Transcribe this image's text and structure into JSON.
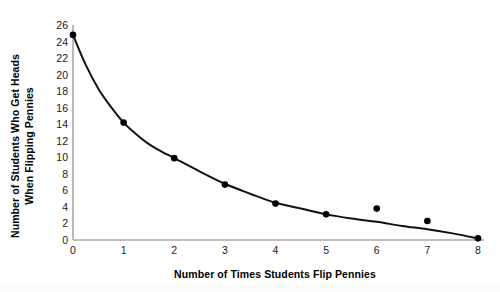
{
  "chart_data": {
    "type": "scatter",
    "title": "",
    "xlabel": "Number of Times Students Flip Pennies",
    "ylabel_line1": "Number of Students Who Get Heads",
    "ylabel_line2": "When Flipping Pennies",
    "x": [
      0,
      1,
      2,
      3,
      4,
      5,
      6,
      7,
      8
    ],
    "values": [
      24.8,
      14.2,
      9.9,
      6.7,
      4.4,
      3.1,
      3.8,
      2.3,
      0.2
    ],
    "fit_curve": {
      "label": "exponential decay trend line",
      "points": [
        [
          0,
          24.8
        ],
        [
          0.25,
          21.2
        ],
        [
          0.5,
          18.3
        ],
        [
          0.75,
          16.1
        ],
        [
          1,
          14.2
        ],
        [
          1.25,
          12.8
        ],
        [
          1.5,
          11.6
        ],
        [
          1.75,
          10.7
        ],
        [
          2,
          9.9
        ],
        [
          2.5,
          8.3
        ],
        [
          3,
          6.8
        ],
        [
          3.5,
          5.6
        ],
        [
          4,
          4.5
        ],
        [
          4.5,
          3.8
        ],
        [
          5,
          3.1
        ],
        [
          5.5,
          2.6
        ],
        [
          6,
          2.2
        ],
        [
          6.5,
          1.7
        ],
        [
          7,
          1.3
        ],
        [
          7.5,
          0.8
        ],
        [
          8,
          0.2
        ]
      ]
    },
    "xlim": [
      0,
      8
    ],
    "ylim": [
      0,
      26
    ],
    "xticks": [
      "0",
      "1",
      "2",
      "3",
      "4",
      "5",
      "6",
      "7",
      "8"
    ],
    "yticks": [
      "0",
      "2",
      "4",
      "6",
      "8",
      "10",
      "12",
      "14",
      "16",
      "18",
      "20",
      "22",
      "24",
      "26"
    ],
    "grid": false,
    "legend": "none",
    "colors": {
      "marker": "#000000",
      "line": "#111111",
      "axis": "#a8a8a8",
      "text": "#000000",
      "background": "#ffffff"
    }
  }
}
